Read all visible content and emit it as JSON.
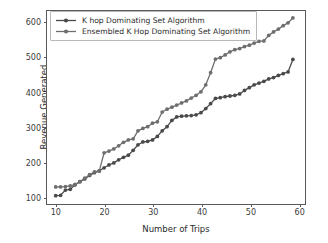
{
  "chart_data": {
    "type": "line",
    "title": "",
    "xlabel": "Number of Trips",
    "ylabel": "Revenue Generated",
    "xlim": [
      8.2,
      61.5
    ],
    "ylim": [
      78,
      632
    ],
    "xticks": [
      10,
      20,
      30,
      40,
      50,
      60
    ],
    "yticks": [
      100,
      200,
      300,
      400,
      500,
      600
    ],
    "grid": false,
    "legend_position": "upper left",
    "marker": "circle",
    "x": [
      10,
      11,
      12,
      13,
      14,
      15,
      16,
      17,
      18,
      19,
      20,
      21,
      22,
      23,
      24,
      25,
      26,
      27,
      28,
      29,
      30,
      31,
      32,
      33,
      34,
      35,
      36,
      37,
      38,
      39,
      40,
      41,
      42,
      43,
      44,
      45,
      46,
      47,
      48,
      49,
      50,
      51,
      52,
      53,
      54,
      55,
      56,
      57,
      58,
      59
    ],
    "series": [
      {
        "name": "K hop Dominating Set Algorithm",
        "color": "#4a4a4a",
        "values": [
          102,
          103,
          118,
          120,
          133,
          142,
          150,
          160,
          168,
          173,
          182,
          190,
          196,
          205,
          212,
          218,
          232,
          248,
          256,
          258,
          262,
          272,
          288,
          300,
          318,
          328,
          330,
          331,
          332,
          334,
          340,
          352,
          366,
          381,
          383,
          386,
          388,
          390,
          394,
          404,
          412,
          420,
          425,
          430,
          437,
          441,
          447,
          452,
          457,
          493
        ]
      },
      {
        "name": "Ensembled K Hop Dominating Set Algorithm",
        "color": "#6e6e6e",
        "values": [
          127,
          127,
          128,
          130,
          134,
          142,
          152,
          162,
          170,
          173,
          225,
          230,
          236,
          245,
          255,
          262,
          265,
          288,
          295,
          300,
          310,
          314,
          342,
          350,
          356,
          362,
          368,
          374,
          382,
          390,
          400,
          420,
          455,
          494,
          498,
          506,
          515,
          521,
          524,
          530,
          534,
          540,
          545,
          546,
          562,
          572,
          580,
          590,
          598,
          612
        ]
      }
    ]
  },
  "legend": {
    "entries": [
      {
        "label": "K hop Dominating Set Algorithm"
      },
      {
        "label": "Ensembled K Hop Dominating Set Algorithm"
      }
    ]
  }
}
